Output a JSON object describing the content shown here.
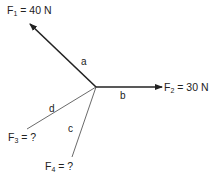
{
  "diagram": {
    "type": "force diagram (concurrent forces)",
    "origin": {
      "x": 96,
      "y": 87
    },
    "forces": [
      {
        "id": "F1",
        "name": "F",
        "sub": "1",
        "value": "= 40 N",
        "segment": "a",
        "end": {
          "x": 30,
          "y": 24
        },
        "arrow": true,
        "color": "#222222",
        "width": 1.6
      },
      {
        "id": "F2",
        "name": "F",
        "sub": "2",
        "value": "= 30 N",
        "segment": "b",
        "end": {
          "x": 162,
          "y": 87
        },
        "arrow": true,
        "color": "#222222",
        "width": 1.6
      },
      {
        "id": "F3",
        "name": "F",
        "sub": "3",
        "value": "= ?",
        "segment": "d",
        "end": {
          "x": 27,
          "y": 129
        },
        "arrow": false,
        "color": "#444444",
        "width": 0.8
      },
      {
        "id": "F4",
        "name": "F",
        "sub": "4",
        "value": "= ?",
        "segment": "c",
        "end": {
          "x": 72,
          "y": 157
        },
        "arrow": false,
        "color": "#444444",
        "width": 0.8
      }
    ]
  }
}
